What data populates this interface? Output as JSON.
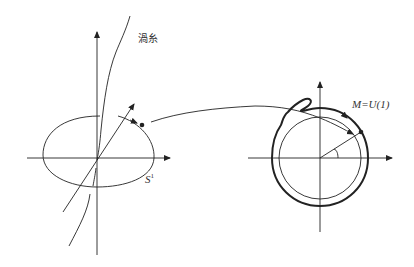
{
  "diagram": {
    "left_panel": {
      "vortex_label": "渦糸",
      "circle_label": "S",
      "circle_label_sup": "1"
    },
    "right_panel": {
      "manifold_label": "M=U(1)"
    },
    "colors": {
      "stroke": "#222222",
      "text": "#333333",
      "background": "#ffffff"
    }
  }
}
